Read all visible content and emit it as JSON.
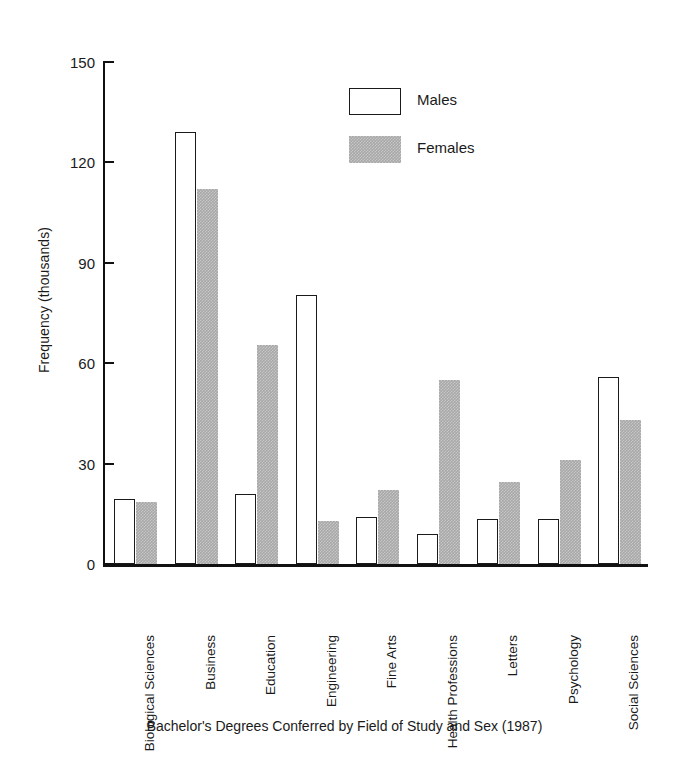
{
  "chart_data": {
    "type": "bar",
    "title": "",
    "caption": "Bachelor's Degrees Conferred by Field of Study and Sex (1987)",
    "xlabel": "",
    "ylabel": "Frequency (thousands)",
    "ylim": [
      0,
      150
    ],
    "yticks": [
      0,
      30,
      60,
      90,
      120,
      150
    ],
    "ytick_labels": [
      "0",
      "30",
      "60",
      "90",
      "120",
      "150"
    ],
    "grid": false,
    "legend_position": "upper-center-right",
    "categories": [
      "Biological Sciences",
      "Business",
      "Education",
      "Engineering",
      "Fine Arts",
      "Health Professions",
      "Letters",
      "Psychology",
      "Social Sciences"
    ],
    "series": [
      {
        "name": "Males",
        "color": "#ffffff",
        "edge_color": "#1a1a1a",
        "values": [
          19.5,
          129,
          21,
          80.5,
          14,
          9,
          13.5,
          13.5,
          56
        ]
      },
      {
        "name": "Females",
        "color": "#a8a8a8",
        "edge_color": "#a8a8a8",
        "values": [
          18.5,
          112,
          65.5,
          13,
          22,
          55,
          24.5,
          31,
          43
        ]
      }
    ]
  },
  "legend": {
    "items": [
      {
        "label": "Males",
        "swatch": "male-swatch"
      },
      {
        "label": "Females",
        "swatch": "female-swatch"
      }
    ]
  },
  "axis": {
    "y_label": "Frequency (thousands)",
    "ticks": [
      "150",
      "120",
      "90",
      "60",
      "30",
      "0"
    ]
  },
  "caption": {
    "text": "Bachelor's Degrees Conferred by Field of Study and Sex (1987)"
  },
  "colors": {
    "ink": "#1a1a1a",
    "female_fill": "#a8a8a8",
    "male_fill": "#ffffff",
    "background": "#ffffff"
  }
}
